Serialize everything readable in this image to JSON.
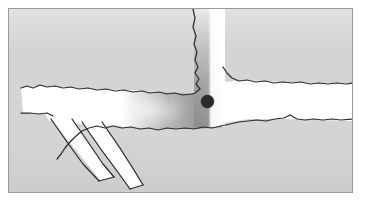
{
  "figure": {
    "title": "Occupancy grid map with robot pose",
    "type": "occupancy-grid-map",
    "caption": "",
    "frame": {
      "border_color": "#9a9a9a",
      "x": 8,
      "y": 8,
      "width": 345,
      "height": 185
    }
  },
  "legend": {
    "unknown_label": "Unknown space",
    "free_label": "Free space",
    "wall_label": "Detected wall",
    "field_label": "Distance / cost field",
    "robot_label": "Robot pose"
  },
  "colors": {
    "background": "#ffffff",
    "unknown": "#d4d4d4",
    "free": "#ffffff",
    "wall": "#2e2e2e",
    "field_near": "#8d8d8d",
    "field_far": "#ffffff",
    "robot": "#2b2b2b",
    "border": "#9a9a9a",
    "goal_tick": "#b9a0a0"
  },
  "robot": {
    "name": "robot-pose",
    "x": 206,
    "y": 100,
    "radius": 6.5,
    "color": "#2b2b2b"
  },
  "goal_marker": {
    "name": "goal-tick",
    "x": 167,
    "y": 99,
    "visible": true
  },
  "regions": [
    {
      "id": "corridor-left",
      "label": "Left horizontal corridor",
      "shape": "free"
    },
    {
      "id": "branch-lower-a",
      "label": "Lower-left diagonal branch A",
      "shape": "free"
    },
    {
      "id": "branch-lower-b",
      "label": "Lower-left diagonal branch B",
      "shape": "free"
    },
    {
      "id": "corridor-vertical",
      "label": "Vertical corridor",
      "shape": "free"
    },
    {
      "id": "corridor-right",
      "label": "Right horizontal corridor",
      "shape": "free"
    },
    {
      "id": "junction",
      "label": "T-junction cost field",
      "shape": "gradient"
    }
  ],
  "chart_data": {
    "type": "heatmap",
    "title": "Occupancy grid map with robot pose",
    "xlabel": "",
    "ylabel": "",
    "grid": false,
    "legend_position": "none",
    "value_scale": {
      "unknown": 0.5,
      "free": 1.0,
      "occupied": 0.0
    },
    "annotations": [
      {
        "name": "robot-pose",
        "x": 206,
        "y": 100,
        "value": "robot"
      },
      {
        "name": "goal-tick",
        "x": 167,
        "y": 99,
        "value": "goal"
      }
    ]
  }
}
